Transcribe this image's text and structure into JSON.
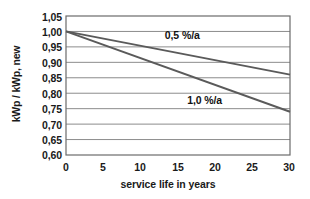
{
  "chart_data": {
    "type": "line",
    "title": "",
    "subtitle": "",
    "xlabel": "service life in  years",
    "ylabel": "kWp / kWp, new",
    "xlim": [
      0,
      30
    ],
    "ylim": [
      0.6,
      1.05
    ],
    "grid": true,
    "legend_position": "inline-annotations",
    "x_ticks": [
      "0",
      "5",
      "10",
      "15",
      "20",
      "25",
      "30"
    ],
    "x_tick_values": [
      0,
      5,
      10,
      15,
      20,
      25,
      30
    ],
    "y_ticks": [
      "0,60",
      "0,65",
      "0,70",
      "0,75",
      "0,80",
      "0,85",
      "0,90",
      "0,95",
      "1,00",
      "1,05"
    ],
    "y_tick_values": [
      0.6,
      0.65,
      0.7,
      0.75,
      0.8,
      0.85,
      0.9,
      0.95,
      1.0,
      1.05
    ],
    "x": [
      0,
      30
    ],
    "series": [
      {
        "name": "0,5 %/a",
        "values": [
          1.0,
          0.86
        ],
        "color": "#5a5a5a",
        "annotation": "0,5 %/a"
      },
      {
        "name": "1,0 %/a",
        "values": [
          1.0,
          0.74
        ],
        "color": "#5a5a5a",
        "annotation": "1,0 %/a"
      }
    ],
    "annotations": [
      {
        "text": "0,5 %/a",
        "x": 13.5,
        "y": 0.985
      },
      {
        "text": "1,0 %/a",
        "x": 16.5,
        "y": 0.775
      }
    ],
    "colors": {
      "line": "#5a5a5a",
      "grid": "#8c8c8c",
      "axis": "#5f5f5f",
      "text": "#1a1a1a",
      "background": "#ffffff"
    }
  }
}
